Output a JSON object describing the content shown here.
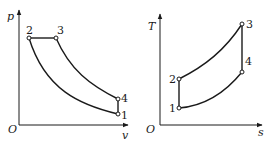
{
  "pv_diagram": {
    "y_axis_label": "p",
    "x_axis_label": "v",
    "origin_label": "O",
    "points": {
      "p1": "1",
      "p2": "2",
      "p3": "3",
      "p4": "4"
    }
  },
  "ts_diagram": {
    "y_axis_label": "T",
    "x_axis_label": "s",
    "origin_label": "O",
    "points": {
      "p1": "1",
      "p2": "2",
      "p3": "3",
      "p4": "4"
    }
  },
  "colors": {
    "stroke": "#1a1a1a",
    "background": "#ffffff"
  }
}
